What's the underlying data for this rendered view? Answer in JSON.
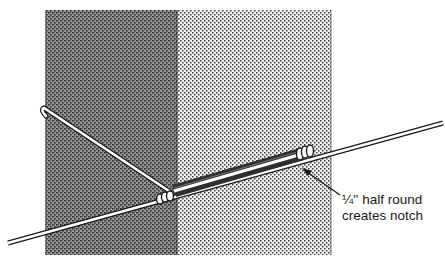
{
  "figure": {
    "type": "technical-illustration",
    "panels": [
      {
        "name": "dark-panel",
        "shade": "dense stipple",
        "color": "#7a7a7a",
        "x": 45,
        "y": 10,
        "width": 132,
        "height": 245
      },
      {
        "name": "light-panel",
        "shade": "light stipple",
        "color": "#c4c4c4",
        "x": 177,
        "y": 10,
        "width": 154,
        "height": 245
      }
    ],
    "callout": {
      "line1": "¼'' half round",
      "line2": "creates notch"
    }
  },
  "colors": {
    "ink": "#1a1a1a",
    "background": "#ffffff",
    "wire": "#ffffff"
  }
}
